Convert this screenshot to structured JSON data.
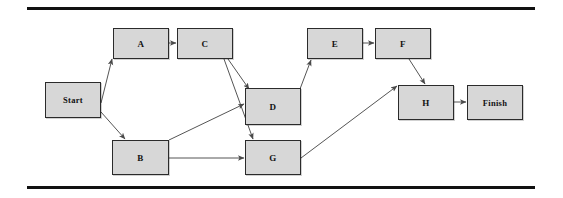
{
  "figure": {
    "width": 563,
    "height": 198,
    "background_color": "#ffffff",
    "rule_color": "#111111"
  },
  "chart_data": {
    "type": "diagram",
    "subtype": "directed-graph",
    "node_fill_color": "#d7d7d7",
    "node_border_color": "#2b2b2b",
    "edge_color": "#555555",
    "nodes": [
      {
        "id": "Start",
        "label": "Start",
        "x": 45,
        "y": 82,
        "w": 56,
        "h": 36
      },
      {
        "id": "A",
        "label": "A",
        "x": 113,
        "y": 28,
        "w": 56,
        "h": 31
      },
      {
        "id": "C",
        "label": "C",
        "x": 177,
        "y": 28,
        "w": 56,
        "h": 31
      },
      {
        "id": "E",
        "label": "E",
        "x": 307,
        "y": 28,
        "w": 56,
        "h": 31
      },
      {
        "id": "F",
        "label": "F",
        "x": 375,
        "y": 28,
        "w": 56,
        "h": 31
      },
      {
        "id": "D",
        "label": "D",
        "x": 245,
        "y": 88,
        "w": 56,
        "h": 37
      },
      {
        "id": "H",
        "label": "H",
        "x": 398,
        "y": 85,
        "w": 56,
        "h": 35
      },
      {
        "id": "Finish",
        "label": "Finish",
        "x": 467,
        "y": 85,
        "w": 56,
        "h": 35
      },
      {
        "id": "B",
        "label": "B",
        "x": 112,
        "y": 140,
        "w": 57,
        "h": 35
      },
      {
        "id": "G",
        "label": "G",
        "x": 245,
        "y": 140,
        "w": 56,
        "h": 35
      }
    ],
    "edges": [
      {
        "from": "Start",
        "to": "A",
        "points": [
          [
            101,
            103
          ],
          [
            112,
            59
          ]
        ]
      },
      {
        "from": "Start",
        "to": "B",
        "points": [
          [
            101,
            112
          ],
          [
            125,
            139
          ]
        ]
      },
      {
        "from": "A",
        "to": "C",
        "points": [
          [
            169,
            43
          ],
          [
            176,
            43
          ]
        ]
      },
      {
        "from": "C",
        "to": "D",
        "points": [
          [
            228,
            59
          ],
          [
            249,
            89
          ]
        ]
      },
      {
        "from": "C",
        "to": "G",
        "points": [
          [
            224,
            59
          ],
          [
            253,
            139
          ]
        ]
      },
      {
        "from": "B",
        "to": "D",
        "points": [
          [
            169,
            140
          ],
          [
            244,
            104
          ]
        ]
      },
      {
        "from": "B",
        "to": "G",
        "points": [
          [
            169,
            158
          ],
          [
            244,
            158
          ]
        ]
      },
      {
        "from": "D",
        "to": "E",
        "points": [
          [
            300,
            89
          ],
          [
            311,
            60
          ]
        ]
      },
      {
        "from": "E",
        "to": "F",
        "points": [
          [
            363,
            43
          ],
          [
            374,
            43
          ]
        ]
      },
      {
        "from": "F",
        "to": "H",
        "points": [
          [
            409,
            59
          ],
          [
            425,
            84
          ]
        ]
      },
      {
        "from": "G",
        "to": "H",
        "points": [
          [
            301,
            158
          ],
          [
            397,
            86
          ]
        ]
      },
      {
        "from": "H",
        "to": "Finish",
        "points": [
          [
            454,
            102
          ],
          [
            466,
            102
          ]
        ]
      }
    ]
  }
}
